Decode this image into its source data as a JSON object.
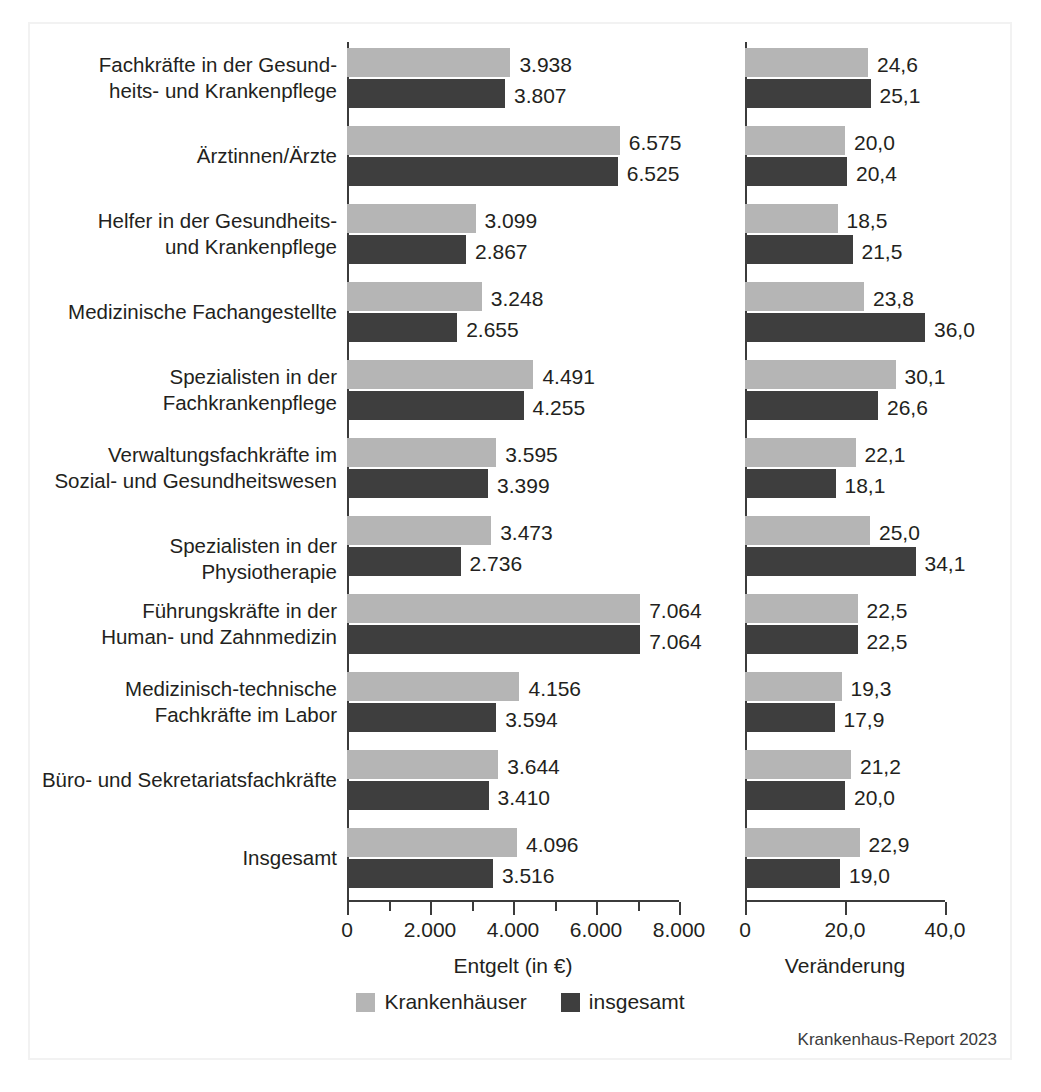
{
  "chart_data": {
    "type": "bar",
    "orientation": "horizontal",
    "title": "",
    "legend": {
      "position": "bottom-center",
      "entries": [
        {
          "name": "Krankenhäuser",
          "color": "#b5b5b5"
        },
        {
          "name": "insgesamt",
          "color": "#3e3e3e"
        }
      ]
    },
    "categories": [
      "Fachkräfte in der Gesundheits- und Krankenpflege",
      "Ärztinnen/Ärzte",
      "Helfer in der Gesundheits- und Krankenpflege",
      "Medizinische Fachangestellte",
      "Spezialisten in der Fachkrankenpflege",
      "Verwaltungsfachkräfte im Sozial- und Gesundheitswesen",
      "Spezialisten in der Physiotherapie",
      "Führungskräfte in der Human- und Zahnmedizin",
      "Medizinisch-technische Fachkräfte im Labor",
      "Büro- und Sekretariatsfachkräfte",
      "Insgesamt"
    ],
    "category_lines": [
      [
        "Fachkräfte in der Gesund-",
        "heits- und Krankenpflege"
      ],
      [
        "Ärztinnen/Ärzte",
        ""
      ],
      [
        "Helfer in der Gesundheits-",
        "und Krankenpflege"
      ],
      [
        "Medizinische Fachangestellte",
        ""
      ],
      [
        "Spezialisten in der",
        "Fachkrankenpflege"
      ],
      [
        "Verwaltungsfachkräfte im",
        "Sozial- und Gesundheitswesen"
      ],
      [
        "Spezialisten in der Physiotherapie",
        ""
      ],
      [
        "Führungskräfte in der",
        "Human- und Zahnmedizin"
      ],
      [
        "Medizinisch-technische",
        "Fachkräfte im Labor"
      ],
      [
        "Büro- und Sekretariatsfachkräfte",
        ""
      ],
      [
        "Insgesamt",
        ""
      ]
    ],
    "panels": [
      {
        "id": "entgelt",
        "xlabel": "Entgelt (in €)",
        "xlim": [
          0,
          8000
        ],
        "tick_values": [
          0,
          1000,
          2000,
          3000,
          4000,
          5000,
          6000,
          7000,
          8000
        ],
        "tick_labels": [
          "0",
          "",
          "2.000",
          "",
          "4.000",
          "",
          "6.000",
          "",
          "8.000"
        ],
        "grid": false,
        "series": [
          {
            "name": "Krankenhäuser",
            "color": "#b5b5b5",
            "values": [
              3938,
              6575,
              3099,
              3248,
              4491,
              3595,
              3473,
              7064,
              4156,
              3644,
              4096
            ],
            "labels": [
              "3.938",
              "6.575",
              "3.099",
              "3.248",
              "4.491",
              "3.595",
              "3.473",
              "7.064",
              "4.156",
              "3.644",
              "4.096"
            ]
          },
          {
            "name": "insgesamt",
            "color": "#3e3e3e",
            "values": [
              3807,
              6525,
              2867,
              2655,
              4255,
              3399,
              2736,
              7064,
              3594,
              3410,
              3516
            ],
            "labels": [
              "3.807",
              "6.525",
              "2.867",
              "2.655",
              "4.255",
              "3.399",
              "2.736",
              "7.064",
              "3.594",
              "3.410",
              "3.516"
            ]
          }
        ]
      },
      {
        "id": "veraenderung",
        "xlabel": "Veränderung",
        "xlim": [
          0,
          40
        ],
        "tick_values": [
          0,
          20,
          40
        ],
        "tick_labels": [
          "0",
          "20,0",
          "40,0"
        ],
        "grid": false,
        "series": [
          {
            "name": "Krankenhäuser",
            "color": "#b5b5b5",
            "values": [
              24.6,
              20.0,
              18.5,
              23.8,
              30.1,
              22.1,
              25.0,
              22.5,
              19.3,
              21.2,
              22.9
            ],
            "labels": [
              "24,6",
              "20,0",
              "18,5",
              "23,8",
              "30,1",
              "22,1",
              "25,0",
              "22,5",
              "19,3",
              "21,2",
              "22,9"
            ]
          },
          {
            "name": "insgesamt",
            "color": "#3e3e3e",
            "values": [
              25.1,
              20.4,
              21.5,
              36.0,
              26.6,
              18.1,
              34.1,
              22.5,
              17.9,
              20.0,
              19.0
            ],
            "labels": [
              "25,1",
              "20,4",
              "21,5",
              "36,0",
              "26,6",
              "18,1",
              "34,1",
              "22,5",
              "17,9",
              "20,0",
              "19,0"
            ]
          }
        ]
      }
    ]
  },
  "footer": {
    "source": "Krankenhaus-Report 2023"
  }
}
